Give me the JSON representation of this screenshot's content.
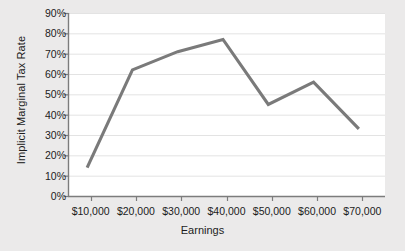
{
  "chart_data": {
    "type": "line",
    "title": "",
    "xlabel": "Earnings",
    "ylabel": "Implicit Marginal Tax Rate",
    "categories": [
      "$10,000",
      "$20,000",
      "$30,000",
      "$40,000",
      "$50,000",
      "$60,000",
      "$70,000"
    ],
    "x": [
      10000,
      20000,
      30000,
      40000,
      50000,
      60000,
      70000
    ],
    "values": [
      14,
      62,
      71,
      77,
      45,
      56,
      33
    ],
    "series": [
      {
        "name": "Implicit Marginal Tax Rate",
        "values": [
          14,
          62,
          71,
          77,
          45,
          56,
          33
        ]
      }
    ],
    "ylim": [
      0,
      90
    ],
    "ytick_values": [
      0,
      10,
      20,
      30,
      40,
      50,
      60,
      70,
      80,
      90
    ],
    "ytick_labels": [
      "0%",
      "10%",
      "20%",
      "30%",
      "40%",
      "50%",
      "60%",
      "70%",
      "80%",
      "90%"
    ],
    "grid": true,
    "grid_axis": "y",
    "legend": false,
    "legend_position": "none",
    "line_color": "#7a7a7a",
    "plot_background": "#ffffff",
    "page_background": "#ebeaea",
    "grid_color": "#e3e3e3",
    "axis_color": "#7c7c7c",
    "text_color": "#1c1c1c"
  }
}
